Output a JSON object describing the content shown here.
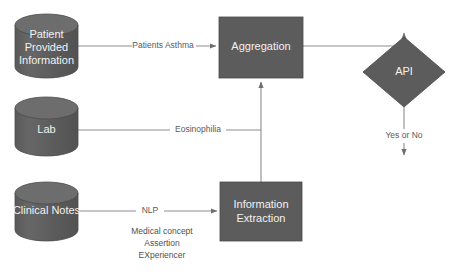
{
  "diagram": {
    "canvas": {
      "width": 458,
      "height": 272,
      "background": "#ffffff"
    },
    "palette": {
      "shape_fill": "#5c5c5c",
      "cylinder_top_fill": "#6b6b6b",
      "shape_stroke": "#4a4a4a",
      "shape_text": "#f2f2f2",
      "edge_stroke": "#8d8d8d",
      "edge_text": "#5a5a5a",
      "note_text": "#4f4f4f"
    },
    "nodes": [
      {
        "id": "patient-provided-information",
        "type": "cylinder",
        "label_lines": [
          "Patient",
          "Provided",
          "Information"
        ],
        "x": 15,
        "y": 14,
        "width": 63,
        "height": 64
      },
      {
        "id": "lab",
        "type": "cylinder",
        "label_lines": [
          "Lab"
        ],
        "x": 15,
        "y": 97,
        "width": 63,
        "height": 59
      },
      {
        "id": "clinical-notes",
        "type": "cylinder",
        "label_lines": [
          "Clinical Notes"
        ],
        "x": 15,
        "y": 182,
        "width": 63,
        "height": 59
      },
      {
        "id": "aggregation",
        "type": "rectangle",
        "label_lines": [
          "Aggregation"
        ],
        "x": 219,
        "y": 17,
        "width": 84,
        "height": 61
      },
      {
        "id": "information-extraction",
        "type": "rectangle",
        "label_lines": [
          "Information",
          "Extraction"
        ],
        "x": 220,
        "y": 182,
        "width": 82,
        "height": 59
      },
      {
        "id": "api",
        "type": "diamond",
        "label_lines": [
          "API"
        ],
        "cx": 404,
        "cy": 72,
        "rx": 41,
        "ry": 35
      }
    ],
    "edges": [
      {
        "id": "patient-to-aggregation",
        "from": "patient-provided-information",
        "to": "aggregation",
        "label": "Patients Asthma",
        "label_x": 163,
        "label_y": 46
      },
      {
        "id": "lab-to-aggregation",
        "from": "lab",
        "to": "aggregation",
        "label": "Eosinophilia",
        "label_x": 198,
        "label_y": 130
      },
      {
        "id": "clinical-notes-to-information-extraction",
        "from": "clinical-notes",
        "to": "information-extraction",
        "label": "NLP",
        "label_x": 150,
        "label_y": 211
      },
      {
        "id": "information-extraction-to-aggregation",
        "from": "information-extraction",
        "to": "aggregation",
        "label": "",
        "label_x": 261,
        "label_y": 130
      },
      {
        "id": "aggregation-to-api",
        "from": "aggregation",
        "to": "api",
        "label": "",
        "label_x": 350,
        "label_y": 40
      },
      {
        "id": "api-output",
        "from": "api",
        "to": "",
        "label": "Yes or No",
        "label_x": 404,
        "label_y": 136
      }
    ],
    "notes": [
      {
        "id": "nlp-task-1",
        "text": "Medical concept",
        "x": 162,
        "y": 232
      },
      {
        "id": "nlp-task-2",
        "text": "Assertion",
        "x": 162,
        "y": 244
      },
      {
        "id": "nlp-task-3",
        "text": "EXperiencer",
        "x": 162,
        "y": 256
      }
    ]
  }
}
